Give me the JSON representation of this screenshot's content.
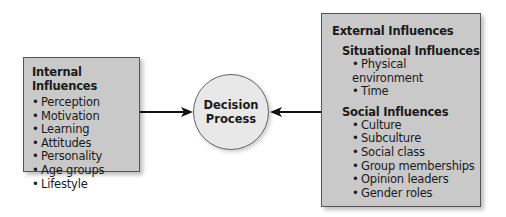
{
  "internal": {
    "title": "Internal Influences",
    "items": [
      "Perception",
      "Motivation",
      "Learning",
      "Attitudes",
      "Personality",
      "Age groups",
      "Lifestyle"
    ]
  },
  "center": {
    "line1": "Decision",
    "line2": "Process"
  },
  "external": {
    "title": "External Influences",
    "situational": {
      "title": "Situational Influences",
      "items": [
        "Physical environment",
        "Time"
      ]
    },
    "social": {
      "title": "Social Influences",
      "items": [
        "Culture",
        "Subculture",
        "Social class",
        "Group memberships",
        "Opinion leaders",
        "Gender roles"
      ]
    }
  },
  "colors": {
    "box_fill": "#c9c9c9",
    "circle_fill": "#e8e8e8",
    "arrow": "#111111"
  }
}
